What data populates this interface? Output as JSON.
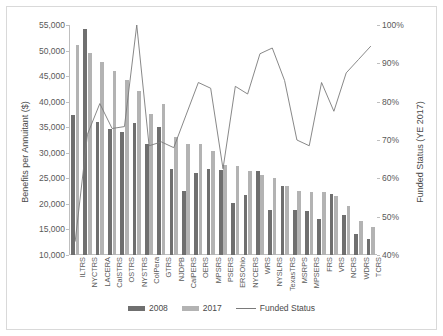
{
  "chart_data": {
    "type": "bar",
    "title": "",
    "xlabel": "",
    "ylabel": "Benefits per Annuitant ($)",
    "y2label": "Funded Status (YE 2017)",
    "ylim": [
      10000,
      55000
    ],
    "yticks": [
      10000,
      15000,
      20000,
      25000,
      30000,
      35000,
      40000,
      45000,
      50000,
      55000
    ],
    "ytick_labels": [
      "10,000",
      "15,000",
      "20,000",
      "25,000",
      "30,000",
      "35,000",
      "40,000",
      "45,000",
      "50,000",
      "55,000"
    ],
    "y2lim": [
      40,
      100
    ],
    "y2ticks": [
      40,
      50,
      60,
      70,
      80,
      90,
      100
    ],
    "y2tick_labels": [
      "40%",
      "50%",
      "60%",
      "70%",
      "80%",
      "90%",
      "100%"
    ],
    "grid": false,
    "legend_position": "bottom",
    "categories": [
      "ILTRS",
      "NYCTRS",
      "LACERA",
      "CalSTRS",
      "OSTRS",
      "NYSTRS",
      "ColPera",
      "GTRS",
      "NJDPB",
      "CalPERS",
      "OERS",
      "MPSRS",
      "PSERS",
      "ERSOhio",
      "NYCERS",
      "WRS",
      "NYSLRS",
      "TexasTRS",
      "MSRPS",
      "MPSERS",
      "FRS",
      "VRS",
      "NCRS",
      "WDRS",
      "TCRS"
    ],
    "series": [
      {
        "name": "2008",
        "type": "bar",
        "color": "#6f6f6f",
        "axis": "left",
        "values": [
          37300,
          54200,
          36000,
          34700,
          34100,
          35800,
          31700,
          35000,
          26800,
          22600,
          26100,
          26800,
          26700,
          20200,
          21700,
          26500,
          18900,
          23500,
          18800,
          18600,
          17000,
          22000,
          17900,
          14200,
          13100
        ]
      },
      {
        "name": "2017",
        "type": "bar",
        "color": "#b3b3b3",
        "axis": "left",
        "values": [
          51100,
          49600,
          47700,
          46000,
          44200,
          42100,
          37600,
          39500,
          33000,
          31800,
          31700,
          30400,
          27700,
          27500,
          26500,
          25700,
          25100,
          23500,
          22600,
          22400,
          22300,
          21500,
          19500,
          16700,
          15500
        ]
      },
      {
        "name": "Funded Status",
        "type": "line",
        "color": "#7a7a7a",
        "axis": "right",
        "values": [
          43.5,
          71.5,
          79.5,
          73.0,
          73.5,
          100.0,
          68.5,
          69.5,
          68.0,
          76.5,
          85.0,
          83.5,
          62.5,
          84.0,
          82.0,
          92.5,
          94.0,
          85.5,
          70.0,
          68.5,
          85.0,
          77.5,
          87.5,
          91.0,
          94.5
        ]
      }
    ]
  },
  "legend": {
    "items": [
      {
        "label": "2008"
      },
      {
        "label": "2017"
      },
      {
        "label": "Funded Status"
      }
    ]
  }
}
